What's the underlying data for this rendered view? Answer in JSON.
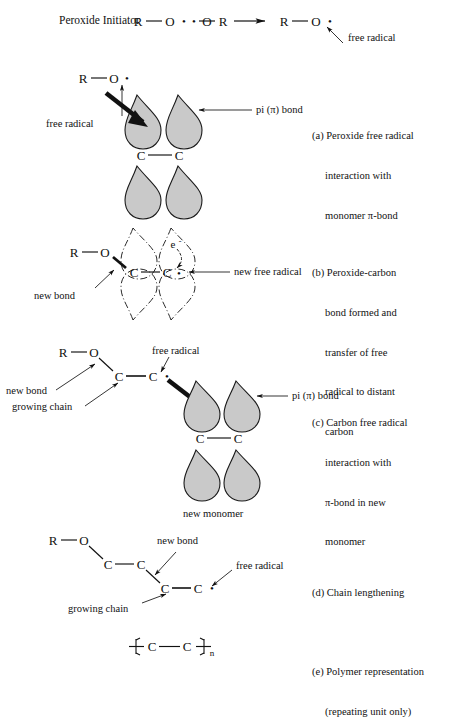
{
  "figure": {
    "background_color": "#ffffff",
    "ink_color": "#111111",
    "lobe_fill_color": "#c9c9c9",
    "lobe_stroke_color": "#1a1a1a"
  },
  "top_reaction": {
    "label": "Peroxide Initiator",
    "reactant": {
      "r_left": "R",
      "bond": "—",
      "o_left": "O",
      "dot_left": "•",
      "dot_right": "•",
      "o_right": "O",
      "bond2": "—",
      "r_right": "R"
    },
    "arrow": "→",
    "product": {
      "r": "R",
      "bond": "—",
      "o": "O",
      "dot": "•"
    },
    "annotation": "free radical"
  },
  "panel_a": {
    "caption_lines": [
      "(a) Peroxide free radical",
      "interaction with",
      "monomer π-bond"
    ],
    "atoms": {
      "r": "R",
      "o": "O",
      "bond": "—",
      "radical_dot": "•"
    },
    "carbon_left": "C",
    "carbon_right": "C",
    "carbon_bond": "—",
    "labels": {
      "free_radical": "free radical",
      "pi_bond": "pi (π) bond"
    }
  },
  "panel_b": {
    "caption_lines": [
      "(b) Peroxide-carbon",
      "bond formed and",
      "transfer of free",
      "radical to distant",
      "carbon"
    ],
    "atoms": {
      "r": "R",
      "o": "O",
      "bond": "—"
    },
    "carbon_left": "C",
    "carbon_right": "C",
    "carbon_bond": "—",
    "electron_label": "e",
    "electron_charge": "-",
    "radical_dot": "•",
    "labels": {
      "new_bond": "new bond",
      "new_free_radical": "new free radical"
    }
  },
  "panel_c": {
    "caption_lines": [
      "(c) Carbon free radical",
      "interaction with",
      "π-bond in new",
      "monomer"
    ],
    "atoms": {
      "r": "R",
      "o": "O",
      "bond": "—"
    },
    "chain_carbon_left": "C",
    "chain_carbon_right": "C",
    "chain_bond": "—",
    "radical_dot": "•",
    "monomer_carbon_left": "C",
    "monomer_carbon_right": "C",
    "monomer_bond": "—",
    "labels": {
      "new_bond": "new bond",
      "growing_chain": "growing chain",
      "free_radical": "free radical",
      "pi_bond": "pi (π) bond",
      "new_monomer": "new monomer"
    }
  },
  "panel_d": {
    "caption_lines": [
      "(d) Chain lengthening"
    ],
    "atoms": {
      "r": "R",
      "o": "O",
      "bond": "—"
    },
    "unit1_left": "C",
    "unit1_right": "C",
    "unit1_bond": "—",
    "unit2_left": "C",
    "unit2_right": "C",
    "unit2_bond": "—",
    "radical_dot": "•",
    "labels": {
      "new_bond": "new bond",
      "free_radical": "free radical",
      "growing_chain": "growing chain"
    }
  },
  "panel_e": {
    "caption_lines": [
      "(e) Polymer representation",
      "(repeating unit only)"
    ],
    "repeat_unit": {
      "carbon_left": "C",
      "carbon_right": "C",
      "bond": "—",
      "subscript": "n"
    }
  }
}
